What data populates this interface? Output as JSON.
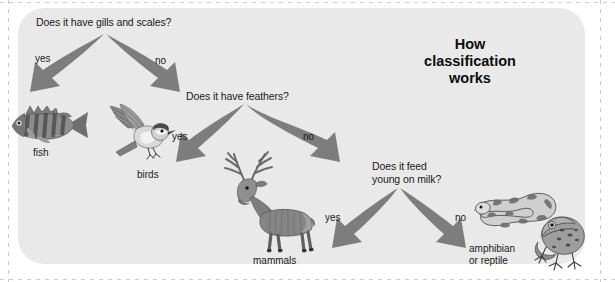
{
  "title": "How\nclassification\nworks",
  "colors": {
    "panel_bg": "#e9e9e9",
    "page_bg": "#ffffff",
    "arrow": "#7d7d7d",
    "text": "#1a1a1a"
  },
  "nodes": [
    {
      "id": "q1",
      "text": "Does it have gills and scales?"
    },
    {
      "id": "q2",
      "text": "Does it have feathers?"
    },
    {
      "id": "q3",
      "text": "Does it feed\nyoung on milk?"
    }
  ],
  "branches": [
    {
      "id": "q1-yes",
      "label": "yes",
      "from": "q1",
      "to": "fish"
    },
    {
      "id": "q1-no",
      "label": "no",
      "from": "q1",
      "to": "q2"
    },
    {
      "id": "q2-yes",
      "label": "yes",
      "from": "q2",
      "to": "birds"
    },
    {
      "id": "q2-no",
      "label": "no",
      "from": "q2",
      "to": "q3"
    },
    {
      "id": "q3-yes",
      "label": "yes",
      "from": "q3",
      "to": "mammals"
    },
    {
      "id": "q3-no",
      "label": "no",
      "from": "q3",
      "to": "amphibian-or-reptile"
    }
  ],
  "outcomes": [
    {
      "id": "fish",
      "label": "fish",
      "animal": "perch-fish-illustration"
    },
    {
      "id": "birds",
      "label": "birds",
      "animal": "flying-bird-illustration"
    },
    {
      "id": "mammals",
      "label": "mammals",
      "animal": "stag-deer-illustration"
    },
    {
      "id": "amphibian-or-reptile",
      "label": "amphibian\nor reptile",
      "animal": "snake-and-frog-illustration"
    }
  ]
}
